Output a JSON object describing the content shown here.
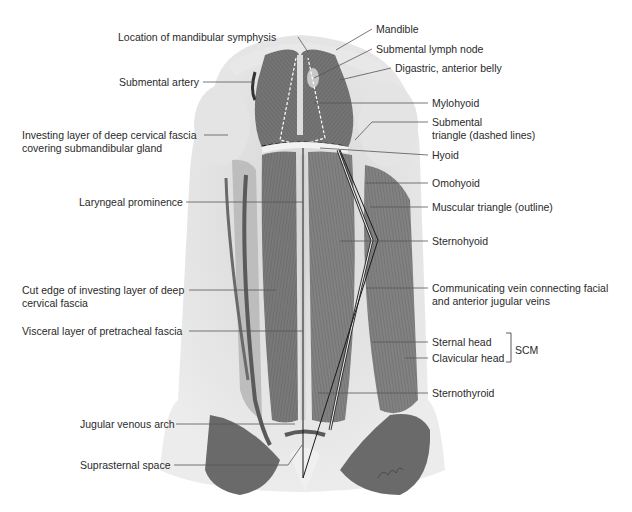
{
  "figure": {
    "left_labels": [
      {
        "text": "Location of mandibular symphysis",
        "x": 118,
        "y": 31,
        "w": 186
      },
      {
        "text": "Submental artery",
        "x": 119,
        "y": 76,
        "w": 82
      },
      {
        "text": "Investing layer of deep cervical fascia",
        "x": 22,
        "y": 130,
        "w": 180
      },
      {
        "text": "covering submandibular gland",
        "x": 22,
        "y": 143,
        "w": 180
      },
      {
        "text": "Laryngeal prominence",
        "x": 79,
        "y": 196,
        "w": 105
      },
      {
        "text": "Cut edge of investing layer of deep",
        "x": 22,
        "y": 284,
        "w": 165
      },
      {
        "text": "cervical fascia",
        "x": 22,
        "y": 297,
        "w": 165
      },
      {
        "text": "Visceral layer of pretracheal fascia",
        "x": 22,
        "y": 325,
        "w": 165
      },
      {
        "text": "Jugular venous arch",
        "x": 80,
        "y": 418,
        "w": 94
      },
      {
        "text": "Suprasternal space",
        "x": 80,
        "y": 459,
        "w": 92
      }
    ],
    "right_labels": [
      {
        "text": "Mandible",
        "x": 376,
        "y": 23
      },
      {
        "text": "Submental lymph node",
        "x": 376,
        "y": 43
      },
      {
        "text": "Digastric, anterior belly",
        "x": 395,
        "y": 62
      },
      {
        "text": "Mylohyoid",
        "x": 432,
        "y": 97
      },
      {
        "text": "Submental",
        "x": 432,
        "y": 117
      },
      {
        "text": "triangle (dashed lines)",
        "x": 432,
        "y": 130
      },
      {
        "text": "Hyoid",
        "x": 432,
        "y": 149
      },
      {
        "text": "Omohyoid",
        "x": 432,
        "y": 177
      },
      {
        "text": "Muscular triangle (outline)",
        "x": 432,
        "y": 201
      },
      {
        "text": "Sternohyoid",
        "x": 432,
        "y": 235
      },
      {
        "text": "Communicating vein connecting facial",
        "x": 432,
        "y": 282
      },
      {
        "text": "and anterior jugular veins",
        "x": 432,
        "y": 295
      },
      {
        "text": "Sternal head",
        "x": 432,
        "y": 336
      },
      {
        "text": "Clavicular head",
        "x": 432,
        "y": 352
      },
      {
        "text": "Sternothyroid",
        "x": 432,
        "y": 387
      }
    ],
    "group_label": {
      "text": "SCM",
      "x": 515,
      "y": 344
    }
  }
}
